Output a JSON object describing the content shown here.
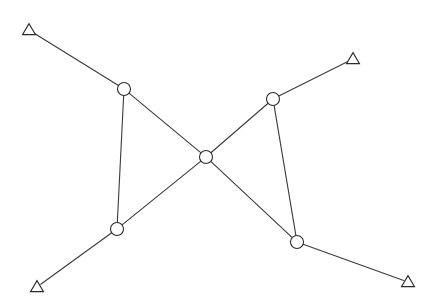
{
  "diagram": {
    "background_color": "#ffffff",
    "edge_color": "#3a3a3a",
    "node_stroke_color": "#2b2b2b",
    "node_fill_color": "#ffffff",
    "edge_stroke_width": 1.1,
    "canvas": {
      "width": 442,
      "height": 306
    },
    "node_shapes": {
      "terminal": "triangle",
      "junction": "circle"
    },
    "circle_radius": 6.5,
    "triangle_half_width": 6.5,
    "triangle_height": 11,
    "nodes": [
      {
        "id": "T1",
        "label": "",
        "shape": "triangle",
        "x": 29,
        "y": 30,
        "name": "terminal-node-top-left"
      },
      {
        "id": "T2",
        "label": "",
        "shape": "triangle",
        "x": 353,
        "y": 59,
        "name": "terminal-node-top-right"
      },
      {
        "id": "T3",
        "label": "",
        "shape": "triangle",
        "x": 37,
        "y": 287,
        "name": "terminal-node-bottom-left"
      },
      {
        "id": "T4",
        "label": "",
        "shape": "triangle",
        "x": 408,
        "y": 282,
        "name": "terminal-node-bottom-right"
      },
      {
        "id": "C1",
        "label": "",
        "shape": "circle",
        "x": 124,
        "y": 89,
        "name": "junction-node-upper-left"
      },
      {
        "id": "C2",
        "label": "",
        "shape": "circle",
        "x": 273,
        "y": 99,
        "name": "junction-node-upper-right"
      },
      {
        "id": "C3",
        "label": "",
        "shape": "circle",
        "x": 206,
        "y": 157,
        "name": "junction-node-center"
      },
      {
        "id": "C4",
        "label": "",
        "shape": "circle",
        "x": 117,
        "y": 229,
        "name": "junction-node-lower-left"
      },
      {
        "id": "C5",
        "label": "",
        "shape": "circle",
        "x": 297,
        "y": 242,
        "name": "junction-node-lower-right"
      }
    ],
    "edges": [
      {
        "from": "T1",
        "to": "C1",
        "name": "edge-top-left-terminal-to-upper-left"
      },
      {
        "from": "C1",
        "to": "C3",
        "name": "edge-upper-left-to-center"
      },
      {
        "from": "C1",
        "to": "C4",
        "name": "edge-upper-left-to-lower-left"
      },
      {
        "from": "C3",
        "to": "C2",
        "name": "edge-center-to-upper-right"
      },
      {
        "from": "C2",
        "to": "T2",
        "name": "edge-upper-right-to-top-right-terminal"
      },
      {
        "from": "C2",
        "to": "C5",
        "name": "edge-upper-right-to-lower-right"
      },
      {
        "from": "C3",
        "to": "C5",
        "name": "edge-center-to-lower-right"
      },
      {
        "from": "C3",
        "to": "C4",
        "name": "edge-center-to-lower-left"
      },
      {
        "from": "C4",
        "to": "T3",
        "name": "edge-lower-left-to-bottom-left-terminal"
      },
      {
        "from": "C5",
        "to": "T4",
        "name": "edge-lower-right-to-bottom-right-terminal"
      }
    ]
  }
}
